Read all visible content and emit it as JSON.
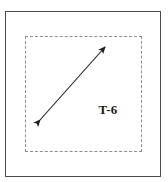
{
  "figure": {
    "background_color": "#ffffff",
    "width": 168,
    "height": 182
  },
  "outer_frame": {
    "name": "outer-frame",
    "border_color": "#4a4a4a",
    "border_style": "solid",
    "x": 5,
    "y": 11,
    "width": 156,
    "height": 166
  },
  "dashed_region": {
    "name": "dashed-region",
    "border_color": "#8d8d8d",
    "border_style": "dashed",
    "x": 25,
    "y": 36,
    "width": 117,
    "height": 116
  },
  "arrow": {
    "name": "double-headed-arrow",
    "color": "#1c1c1c",
    "style": "double-headed",
    "start_x": 40,
    "start_y": 120,
    "end_x": 105,
    "end_y": 47,
    "stroke_width": 1
  },
  "label": {
    "text": "T-6",
    "color": "#1c1c1c",
    "x": 105,
    "y": 113
  }
}
